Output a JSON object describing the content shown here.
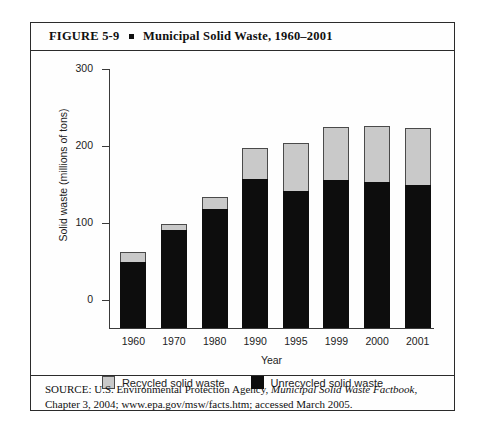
{
  "figure": {
    "label": "FIGURE  5-9",
    "title": "Municipal Solid Waste, 1960–2001",
    "source_prefix": "SOURCE: U.S. Environmental Protection Agency, ",
    "source_italic": "Municipal Solid Waste Factbook",
    "source_suffix": ", Chapter 3, 2004; www.epa.gov/msw/facts.htm; accessed March 2005."
  },
  "colors": {
    "recycled": "#c9c9c9",
    "unrecycled": "#0d0d0d",
    "axis": "#3a3a3a",
    "frame": "#2b2b2b"
  },
  "chart_data": {
    "type": "bar",
    "stacked": true,
    "title": "Municipal Solid Waste, 1960–2001",
    "xlabel": "Year",
    "ylabel": "Solid waste (millions of tons)",
    "categories": [
      "1960",
      "1970",
      "1980",
      "1990",
      "1995",
      "1999",
      "2000",
      "2001"
    ],
    "series": [
      {
        "name": "Unrecycled solid waste",
        "color": "#0d0d0d",
        "values": [
          77,
          113,
          138,
          173,
          159,
          171,
          169,
          166
        ]
      },
      {
        "name": "Recycled solid waste",
        "color": "#c9c9c9",
        "values": [
          11,
          8,
          14,
          35,
          55,
          62,
          65,
          66
        ]
      }
    ],
    "totals": [
      88,
      121,
      152,
      208,
      214,
      233,
      234,
      232
    ],
    "ylim": [
      0,
      300
    ],
    "yticks": [
      0,
      100,
      200,
      300
    ],
    "ytick_labels": [
      "0",
      "100",
      "200",
      "300"
    ],
    "grid": false,
    "legend_position": "bottom",
    "legend": [
      "Recycled solid waste",
      "Unrecycled solid waste"
    ]
  }
}
